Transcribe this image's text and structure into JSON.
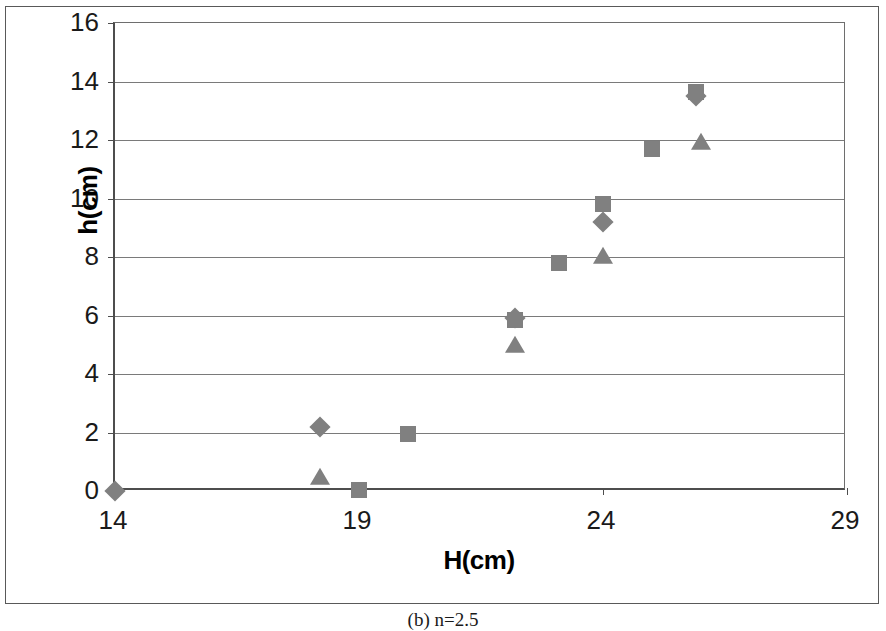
{
  "figure": {
    "caption": "(b) n=2.5"
  },
  "chart_data": {
    "type": "scatter",
    "title": "",
    "xlabel": "H(cm)",
    "ylabel": "h(cm)",
    "xlim": [
      14,
      29
    ],
    "ylim": [
      0,
      16
    ],
    "xticks": [
      14,
      19,
      24,
      29
    ],
    "yticks": [
      0,
      2,
      4,
      6,
      8,
      10,
      12,
      14,
      16
    ],
    "xtick_labels": [
      "14",
      "19",
      "24",
      "29"
    ],
    "ytick_labels": [
      "0",
      "2",
      "4",
      "6",
      "8",
      "10",
      "12",
      "14",
      "16"
    ],
    "grid": "horizontal",
    "legend": "none",
    "marker_color": "#808080",
    "series": [
      {
        "name": "series-diamond",
        "marker": "diamond",
        "points": [
          {
            "x": 14.0,
            "y": 0.0
          },
          {
            "x": 18.2,
            "y": 2.2
          },
          {
            "x": 22.2,
            "y": 5.9
          },
          {
            "x": 24.0,
            "y": 9.2
          },
          {
            "x": 25.9,
            "y": 13.5
          }
        ]
      },
      {
        "name": "series-square",
        "marker": "square",
        "points": [
          {
            "x": 19.0,
            "y": 0.05
          },
          {
            "x": 20.0,
            "y": 1.95
          },
          {
            "x": 22.2,
            "y": 5.85
          },
          {
            "x": 23.1,
            "y": 7.8
          },
          {
            "x": 24.0,
            "y": 9.8
          },
          {
            "x": 25.0,
            "y": 11.7
          },
          {
            "x": 25.9,
            "y": 13.65
          }
        ]
      },
      {
        "name": "series-triangle",
        "marker": "triangle",
        "points": [
          {
            "x": 18.2,
            "y": 0.45
          },
          {
            "x": 22.2,
            "y": 4.95
          },
          {
            "x": 24.0,
            "y": 8.0
          },
          {
            "x": 26.0,
            "y": 11.9
          }
        ]
      }
    ]
  }
}
